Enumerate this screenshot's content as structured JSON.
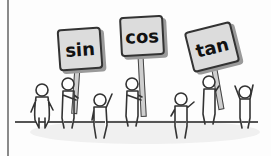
{
  "illustration": {
    "description": "Cartoon stick figures holding signs with trigonometric function names",
    "signs": [
      {
        "label": "sin"
      },
      {
        "label": "cos"
      },
      {
        "label": "tan"
      }
    ],
    "colors": {
      "sign_fill": "#dcdcdc",
      "outline": "#333333",
      "ground": "#555555",
      "left_rule": "#8a8a8a"
    },
    "figure_count": 7
  }
}
